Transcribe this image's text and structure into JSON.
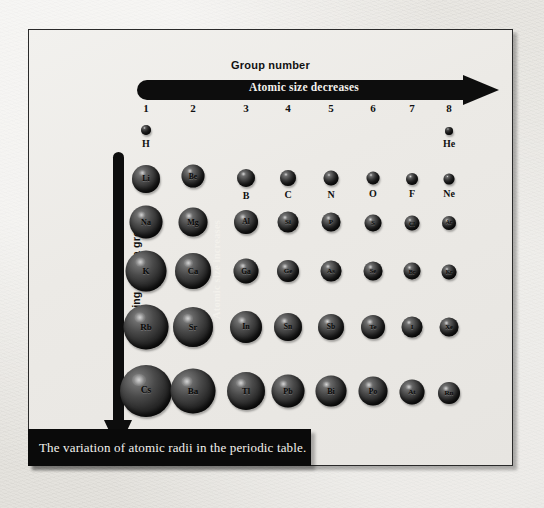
{
  "figure": {
    "caption": "The variation of atomic radii in the periodic table.",
    "top_axis": {
      "title": "Group number",
      "arrow_label": "Atomic size decreases",
      "group_numbers": [
        "1",
        "2",
        "3",
        "4",
        "5",
        "6",
        "7",
        "8"
      ]
    },
    "side_axis": {
      "title": "Going down a group",
      "arrow_label": "Atomic size increases"
    },
    "colors": {
      "paper": "#e9e8e4",
      "frame_border": "#2a2a2a",
      "arrow": "#0d0d0d",
      "caption_bar": "#0a0a0a",
      "caption_text": "#f4f2ee",
      "sphere_highlight": "#8d8d8d",
      "sphere_shadow": "#0b0b0b"
    }
  },
  "chart_data": {
    "type": "scatter",
    "title": "The variation of atomic radii in the periodic table.",
    "xlabel": "Group number",
    "ylabel": "Going down a group",
    "annotations": [
      "Atomic size decreases",
      "Atomic size increases"
    ],
    "grid": false,
    "legend": null,
    "x": [
      1,
      2,
      3,
      4,
      5,
      6,
      7,
      8
    ],
    "x_tick_labels": [
      "1",
      "2",
      "3",
      "4",
      "5",
      "6",
      "7",
      "8"
    ],
    "rows": [
      {
        "period": 1,
        "label_position": "below",
        "atoms": [
          {
            "symbol": "H",
            "group": 1,
            "cx": 145,
            "cy": 129,
            "d": 10,
            "font": 0
          },
          {
            "symbol": "He",
            "group": 8,
            "cx": 448,
            "cy": 130,
            "d": 8,
            "font": 0
          }
        ]
      },
      {
        "period": 2,
        "label_position": "mixed",
        "atoms": [
          {
            "symbol": "Li",
            "group": 1,
            "cx": 145,
            "cy": 178,
            "d": 28,
            "font": 8,
            "inside": true
          },
          {
            "symbol": "Be",
            "group": 2,
            "cx": 192,
            "cy": 175,
            "d": 23,
            "font": 7.5,
            "inside": true
          },
          {
            "symbol": "B",
            "group": 3,
            "cx": 245,
            "cy": 177,
            "d": 18,
            "font": 0
          },
          {
            "symbol": "C",
            "group": 4,
            "cx": 287,
            "cy": 177,
            "d": 16,
            "font": 0
          },
          {
            "symbol": "N",
            "group": 5,
            "cx": 330,
            "cy": 177,
            "d": 15,
            "font": 0
          },
          {
            "symbol": "O",
            "group": 6,
            "cx": 372,
            "cy": 177,
            "d": 13,
            "font": 0
          },
          {
            "symbol": "F",
            "group": 7,
            "cx": 411,
            "cy": 178,
            "d": 12,
            "font": 0
          },
          {
            "symbol": "Ne",
            "group": 8,
            "cx": 448,
            "cy": 178,
            "d": 11,
            "font": 0
          }
        ]
      },
      {
        "period": 3,
        "label_position": "inside",
        "atoms": [
          {
            "symbol": "Na",
            "group": 1,
            "cx": 145,
            "cy": 221,
            "d": 33,
            "font": 8,
            "inside": true
          },
          {
            "symbol": "Mg",
            "group": 2,
            "cx": 192,
            "cy": 221,
            "d": 29,
            "font": 8,
            "inside": true
          },
          {
            "symbol": "Al",
            "group": 3,
            "cx": 245,
            "cy": 221,
            "d": 24,
            "font": 7.5,
            "inside": true
          },
          {
            "symbol": "Si",
            "group": 4,
            "cx": 287,
            "cy": 221,
            "d": 21,
            "font": 7,
            "inside": true
          },
          {
            "symbol": "P",
            "group": 5,
            "cx": 330,
            "cy": 221,
            "d": 19,
            "font": 7,
            "inside": true
          },
          {
            "symbol": "S",
            "group": 6,
            "cx": 372,
            "cy": 222,
            "d": 17,
            "font": 6.5,
            "inside": true
          },
          {
            "symbol": "Cl",
            "group": 7,
            "cx": 411,
            "cy": 222,
            "d": 15,
            "font": 6,
            "inside": true
          },
          {
            "symbol": "Ar",
            "group": 8,
            "cx": 448,
            "cy": 222,
            "d": 14,
            "font": 5.5,
            "inside": true
          }
        ]
      },
      {
        "period": 4,
        "label_position": "inside",
        "atoms": [
          {
            "symbol": "K",
            "group": 1,
            "cx": 145,
            "cy": 270,
            "d": 41,
            "font": 9,
            "inside": true
          },
          {
            "symbol": "Ca",
            "group": 2,
            "cx": 192,
            "cy": 270,
            "d": 36,
            "font": 8.5,
            "inside": true
          },
          {
            "symbol": "Ga",
            "group": 3,
            "cx": 245,
            "cy": 270,
            "d": 25,
            "font": 7.5,
            "inside": true
          },
          {
            "symbol": "Ge",
            "group": 4,
            "cx": 287,
            "cy": 270,
            "d": 22,
            "font": 7,
            "inside": true
          },
          {
            "symbol": "As",
            "group": 5,
            "cx": 330,
            "cy": 270,
            "d": 21,
            "font": 7,
            "inside": true
          },
          {
            "symbol": "Se",
            "group": 6,
            "cx": 372,
            "cy": 270,
            "d": 19,
            "font": 6.5,
            "inside": true
          },
          {
            "symbol": "Br",
            "group": 7,
            "cx": 411,
            "cy": 270,
            "d": 17,
            "font": 6,
            "inside": true
          },
          {
            "symbol": "Kr",
            "group": 8,
            "cx": 448,
            "cy": 271,
            "d": 15,
            "font": 5.5,
            "inside": true
          }
        ]
      },
      {
        "period": 5,
        "label_position": "inside",
        "atoms": [
          {
            "symbol": "Rb",
            "group": 1,
            "cx": 145,
            "cy": 326,
            "d": 45,
            "font": 9,
            "inside": true
          },
          {
            "symbol": "Sr",
            "group": 2,
            "cx": 192,
            "cy": 326,
            "d": 40,
            "font": 8.5,
            "inside": true
          },
          {
            "symbol": "In",
            "group": 3,
            "cx": 245,
            "cy": 326,
            "d": 32,
            "font": 8,
            "inside": true
          },
          {
            "symbol": "Sn",
            "group": 4,
            "cx": 287,
            "cy": 326,
            "d": 28,
            "font": 7.5,
            "inside": true
          },
          {
            "symbol": "Sb",
            "group": 5,
            "cx": 330,
            "cy": 326,
            "d": 26,
            "font": 7.5,
            "inside": true
          },
          {
            "symbol": "Te",
            "group": 6,
            "cx": 372,
            "cy": 326,
            "d": 24,
            "font": 7,
            "inside": true
          },
          {
            "symbol": "I",
            "group": 7,
            "cx": 411,
            "cy": 326,
            "d": 21,
            "font": 7,
            "inside": true
          },
          {
            "symbol": "Xe",
            "group": 8,
            "cx": 448,
            "cy": 326,
            "d": 19,
            "font": 6.5,
            "inside": true
          }
        ]
      },
      {
        "period": 6,
        "label_position": "inside",
        "atoms": [
          {
            "symbol": "Cs",
            "group": 1,
            "cx": 145,
            "cy": 390,
            "d": 52,
            "font": 9.5,
            "inside": true
          },
          {
            "symbol": "Ba",
            "group": 2,
            "cx": 192,
            "cy": 390,
            "d": 45,
            "font": 9,
            "inside": true
          },
          {
            "symbol": "Tl",
            "group": 3,
            "cx": 245,
            "cy": 390,
            "d": 38,
            "font": 8.5,
            "inside": true
          },
          {
            "symbol": "Pb",
            "group": 4,
            "cx": 287,
            "cy": 390,
            "d": 33,
            "font": 8,
            "inside": true
          },
          {
            "symbol": "Bi",
            "group": 5,
            "cx": 330,
            "cy": 390,
            "d": 31,
            "font": 8,
            "inside": true
          },
          {
            "symbol": "Po",
            "group": 6,
            "cx": 372,
            "cy": 390,
            "d": 29,
            "font": 7.5,
            "inside": true
          },
          {
            "symbol": "At",
            "group": 7,
            "cx": 411,
            "cy": 391,
            "d": 25,
            "font": 7,
            "inside": true
          },
          {
            "symbol": "Rn",
            "group": 8,
            "cx": 448,
            "cy": 392,
            "d": 22,
            "font": 7,
            "inside": true
          }
        ]
      }
    ],
    "group_x_positions": [
      145,
      192,
      245,
      287,
      330,
      372,
      411,
      448
    ]
  }
}
